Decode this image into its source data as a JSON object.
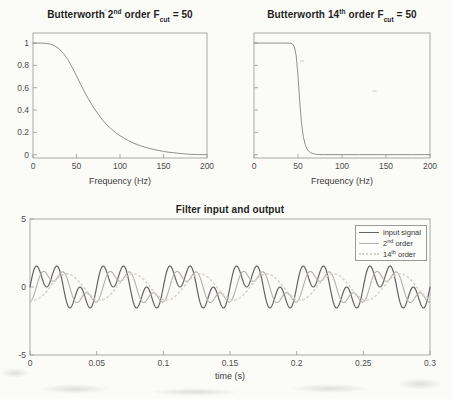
{
  "figure": {
    "description": "MATLAB figure with three subplots: two Butterworth filter frequency responses and one time-domain filter input/output plot"
  },
  "titles": {
    "plot1": {
      "pre": "Butterworth 2",
      "sup": "nd",
      "mid": " order F",
      "sub": "cut",
      "post": " = 50"
    },
    "plot2": {
      "pre": "Butterworth 14",
      "sup": "th",
      "mid": " order F",
      "sub": "cut",
      "post": " = 50"
    },
    "plot3": "Filter input and output"
  },
  "labels": {
    "freq_xlabel_left": "Frequency (Hz)",
    "freq_xlabel_right": "Frequency (Hz)",
    "time_xlabel": "time (s)"
  },
  "legend": {
    "items": [
      {
        "pre": "input signal",
        "sup": "",
        "post": "",
        "style": "solid",
        "color": "#636363"
      },
      {
        "pre": "2",
        "sup": "nd",
        "post": " order",
        "style": "solid",
        "color": "#b5b0a8"
      },
      {
        "pre": "14",
        "sup": "th",
        "post": " order",
        "style": "dotted",
        "color": "#d8d2c6"
      }
    ]
  },
  "colors": {
    "background": "#fbfbf8",
    "spine": "#a9a9a9",
    "tick_text": "#4d4d4d",
    "title_text": "#1f1f1f",
    "response_curve": "#8f8f8f",
    "input": "#636363",
    "order2": "#b5b0a8",
    "order14": "#d8d2c6",
    "legend_border": "#9a9a9a"
  },
  "chart_data": [
    {
      "id": "butter2",
      "type": "line",
      "title": "Butterworth 2nd order F_cut = 50",
      "xlabel": "Frequency (Hz)",
      "ylabel": "",
      "xlim": [
        0,
        200
      ],
      "ylim": [
        -0.03,
        1.09
      ],
      "grid": false,
      "x_ticks": [
        {
          "v": 0,
          "l": "0"
        },
        {
          "v": 50,
          "l": "50"
        },
        {
          "v": 100,
          "l": "100"
        },
        {
          "v": 150,
          "l": "150"
        },
        {
          "v": 200,
          "l": "200"
        }
      ],
      "y_ticks": [
        {
          "v": 0,
          "l": "0"
        },
        {
          "v": 0.2,
          "l": "0.2"
        },
        {
          "v": 0.4,
          "l": "0.4"
        },
        {
          "v": 0.6,
          "l": "0.6"
        },
        {
          "v": 0.8,
          "l": "0.8"
        },
        {
          "v": 1,
          "l": "1"
        }
      ],
      "series": [
        {
          "name": "magnitude-response-order-2",
          "color": "#8f8f8f",
          "width": 1,
          "style": "solid",
          "x": [
            0,
            5,
            10,
            15,
            20,
            25,
            30,
            35,
            40,
            45,
            50,
            55,
            60,
            65,
            70,
            75,
            80,
            85,
            90,
            95,
            100,
            105,
            110,
            115,
            120,
            125,
            130,
            135,
            140,
            145,
            150,
            155,
            160,
            165,
            170,
            175,
            180,
            185,
            190,
            195,
            200
          ],
          "y": [
            1,
            1,
            0.999,
            0.997,
            0.99,
            0.975,
            0.948,
            0.907,
            0.852,
            0.784,
            0.707,
            0.627,
            0.551,
            0.481,
            0.418,
            0.363,
            0.309,
            0.266,
            0.229,
            0.197,
            0.169,
            0.146,
            0.124,
            0.105,
            0.09,
            0.076,
            0.064,
            0.054,
            0.044,
            0.037,
            0.029,
            0.023,
            0.018,
            0.014,
            0.01,
            0.007,
            0.004,
            0.002,
            0.001,
            0.0005,
            0
          ]
        }
      ]
    },
    {
      "id": "butter14",
      "type": "line",
      "title": "Butterworth 14th order F_cut = 50",
      "xlabel": "Frequency (Hz)",
      "ylabel": "",
      "xlim": [
        0,
        200
      ],
      "ylim": [
        -0.03,
        1.09
      ],
      "grid": false,
      "x_ticks": [
        {
          "v": 0,
          "l": "0"
        },
        {
          "v": 50,
          "l": "50"
        },
        {
          "v": 100,
          "l": "100"
        },
        {
          "v": 150,
          "l": "150"
        },
        {
          "v": 200,
          "l": "200"
        }
      ],
      "y_ticks": [
        {
          "v": 0,
          "l": ""
        },
        {
          "v": 0.2,
          "l": ""
        },
        {
          "v": 0.4,
          "l": ""
        },
        {
          "v": 0.6,
          "l": ""
        },
        {
          "v": 0.8,
          "l": ""
        },
        {
          "v": 1,
          "l": ""
        }
      ],
      "series": [
        {
          "name": "magnitude-response-order-14",
          "color": "#8f8f8f",
          "width": 1,
          "style": "solid",
          "x": [
            0,
            10,
            20,
            30,
            35,
            40,
            42,
            44,
            46,
            48,
            50,
            52,
            54,
            56,
            58,
            60,
            62,
            64,
            66,
            68,
            70,
            75,
            80,
            100,
            120,
            140,
            160,
            180,
            200
          ],
          "y": [
            1,
            1,
            1,
            1,
            1,
            0.999,
            0.998,
            0.99,
            0.964,
            0.883,
            0.707,
            0.472,
            0.285,
            0.164,
            0.094,
            0.055,
            0.032,
            0.019,
            0.011,
            0.007,
            0.004,
            0.001,
            0.0005,
            0,
            0,
            0,
            0,
            0,
            0
          ]
        }
      ]
    },
    {
      "id": "timeplot",
      "type": "line",
      "title": "Filter input and output",
      "xlabel": "time (s)",
      "ylabel": "",
      "xlim": [
        0,
        0.3
      ],
      "ylim": [
        -5,
        5
      ],
      "grid": false,
      "legend_position": "northeast",
      "x_ticks": [
        {
          "v": 0,
          "l": "0"
        },
        {
          "v": 0.05,
          "l": "0.05"
        },
        {
          "v": 0.1,
          "l": "0.1"
        },
        {
          "v": 0.15,
          "l": "0.15"
        },
        {
          "v": 0.2,
          "l": "0.2"
        },
        {
          "v": 0.25,
          "l": "0.25"
        },
        {
          "v": 0.3,
          "l": "0.3"
        }
      ],
      "y_ticks": [
        {
          "v": -5,
          "l": "-5"
        },
        {
          "v": 0,
          "l": "0"
        },
        {
          "v": 5,
          "l": "5"
        }
      ],
      "series": [
        {
          "name": "input signal",
          "color": "#636363",
          "width": 1.2,
          "style": "solid",
          "signal": {
            "components": [
              {
                "freq": 20,
                "amp": 1,
                "phase": 0
              },
              {
                "freq": 60,
                "amp": 1,
                "phase": 0
              }
            ]
          }
        },
        {
          "name": "2nd order",
          "color": "#b5b0a8",
          "width": 1.1,
          "style": "solid",
          "signal": {
            "components": [
              {
                "freq": 20,
                "amp": 0.99,
                "phase": -0.59
              },
              {
                "freq": 60,
                "amp": 0.57,
                "phase": -1.83
              }
            ]
          }
        },
        {
          "name": "14th order",
          "color": "#d8d2c6",
          "width": 1.5,
          "style": "dotted",
          "signal": {
            "components": [
              {
                "freq": 20,
                "amp": 0.97,
                "phase": -1.9
              }
            ]
          }
        }
      ]
    }
  ]
}
